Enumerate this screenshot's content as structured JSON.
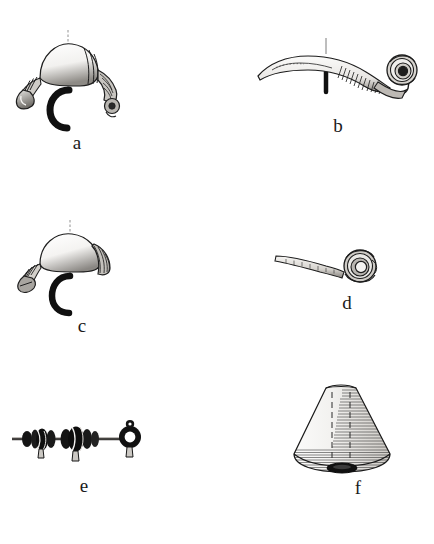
{
  "plate": {
    "title": "Archaeological artifact drawing plate",
    "background_color": "#ffffff",
    "ink_color": "#1a1a1a",
    "width": 434,
    "height": 544
  },
  "figures": [
    {
      "key": "a",
      "label": "a",
      "name": "bow-fibula-with-ribbed-bands",
      "description": "Bronze bow fibula with swollen ribbed bow, foot knob and separate C-shaped cross-section profile",
      "label_x": 57,
      "label_y": 133
    },
    {
      "key": "b",
      "label": "b",
      "name": "elongated-fibula-with-spiral-coil",
      "description": "Long curved fibula with flat blade, hatched shank and spiral coil head, with bar section mark",
      "label_x": 318,
      "label_y": 116
    },
    {
      "key": "c",
      "label": "c",
      "name": "leech-bow-fibula",
      "description": "Leech-shaped bow fibula with hatched terminals and C-shaped cross-section profile",
      "label_x": 62,
      "label_y": 316
    },
    {
      "key": "d",
      "label": "d",
      "name": "pin-with-spiral-head",
      "description": "Slender pin terminating in a spiral disc head",
      "label_x": 327,
      "label_y": 293
    },
    {
      "key": "e",
      "label": "e",
      "name": "bead-string-with-pendants",
      "description": "Dark glass and metal beads with pendant loops threaded on a rod, plus separate ring pendant",
      "label_x": 64,
      "label_y": 476
    },
    {
      "key": "f",
      "label": "f",
      "name": "conical-vessel-spindle-whorl",
      "description": "Conical object with dense horizontal hatching, dashed interior construction lines and open base",
      "label_x": 338,
      "label_y": 478
    }
  ]
}
